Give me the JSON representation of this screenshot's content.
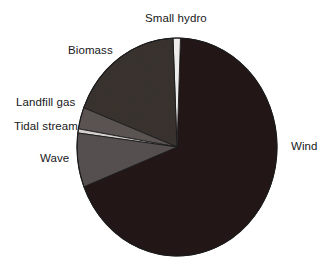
{
  "chart_data": {
    "type": "pie",
    "title": "",
    "subtitle": "",
    "xlabel": "",
    "ylabel": "",
    "legend_position": "none",
    "grid": false,
    "labels_position": "outside",
    "categories": [
      "Wind",
      "Small hydro",
      "Biomass",
      "Landfill gas",
      "Tidal stream",
      "Wave"
    ],
    "values": [
      68.5,
      1.2,
      18.5,
      3.2,
      0.6,
      8.0
    ],
    "units": "percent",
    "slices": [
      {
        "label": "Wind",
        "value": 68.5,
        "color": "#231515",
        "start_angle_deg": 2,
        "end_angle_deg": 248.6,
        "label_x": 291,
        "label_y": 140
      },
      {
        "label": "Small hydro",
        "value": 1.2,
        "color": "#f2f0ee",
        "start_angle_deg": -2.3,
        "end_angle_deg": 2,
        "label_x": 145,
        "label_y": 12
      },
      {
        "label": "Biomass",
        "value": 18.5,
        "color": "#3a3230",
        "start_angle_deg": -68.9,
        "end_angle_deg": -2.3,
        "label_x": 68,
        "label_y": 44
      },
      {
        "label": "Landfill gas",
        "value": 3.2,
        "color": "#5b5553",
        "start_angle_deg": -80.4,
        "end_angle_deg": -68.9,
        "label_x": 16,
        "label_y": 96
      },
      {
        "label": "Tidal stream",
        "value": 0.6,
        "color": "#d8d4d1",
        "start_angle_deg": -82.6,
        "end_angle_deg": -80.4,
        "label_x": 14,
        "label_y": 120
      },
      {
        "label": "Wave",
        "value": 8.0,
        "color": "#565050",
        "start_angle_deg": -111.4,
        "end_angle_deg": -82.6,
        "label_x": 40,
        "label_y": 152
      }
    ],
    "geometry": {
      "center_x": 177,
      "center_y": 147,
      "radius_x": 100,
      "radius_y": 109
    },
    "colors": {
      "background": "#ffffff",
      "text": "#18181a",
      "outline": "#1b1b1b",
      "wind": "#231515",
      "small_hydro": "#f2f0ee",
      "biomass": "#3a3230",
      "landfill_gas": "#5b5553",
      "tidal_stream": "#d8d4d1",
      "wave": "#565050"
    }
  },
  "labels": {
    "small_hydro": "Small hydro",
    "biomass": "Biomass",
    "landfill_gas": "Landfill gas",
    "tidal_stream": "Tidal stream",
    "wave": "Wave",
    "wind": "Wind"
  }
}
